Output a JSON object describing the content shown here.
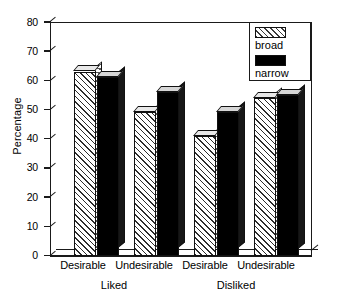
{
  "chart_data": {
    "type": "bar",
    "title": "",
    "xlabel": "",
    "ylabel": "Percentage",
    "ylim": [
      0,
      80
    ],
    "yticks": [
      0,
      10,
      20,
      30,
      40,
      50,
      60,
      70,
      80
    ],
    "grid": false,
    "legend_position": "top-right",
    "categories": [
      "Desirable",
      "Undesirable",
      "Desirable",
      "Undesirable"
    ],
    "groups": [
      {
        "label": "Liked",
        "categories": [
          "Desirable",
          "Undesirable"
        ]
      },
      {
        "label": "Disliked",
        "categories": [
          "Desirable",
          "Undesirable"
        ]
      }
    ],
    "series": [
      {
        "name": "broad",
        "values": [
          63,
          49,
          41,
          54
        ]
      },
      {
        "name": "narrow",
        "values": [
          61,
          56,
          49,
          55
        ]
      }
    ]
  },
  "legend": {
    "items": [
      {
        "label": "broad",
        "swatch": "hatched-swatch"
      },
      {
        "label": "narrow",
        "swatch": "solid-black-swatch"
      }
    ]
  },
  "axis": {
    "y_title": "Percentage",
    "y_ticks": [
      "0",
      "10",
      "20",
      "30",
      "40",
      "50",
      "60",
      "70",
      "80"
    ]
  },
  "x_labels": [
    "Desirable",
    "Undesirable",
    "Desirable",
    "Undesirable"
  ],
  "group_labels": [
    "Liked",
    "Disliked"
  ],
  "colors": {
    "axis": "#1a1a1a",
    "broad_fill": "#ffffff",
    "broad_hatch": "#2b2b2b",
    "narrow_fill": "#000000",
    "background": "#ffffff"
  }
}
